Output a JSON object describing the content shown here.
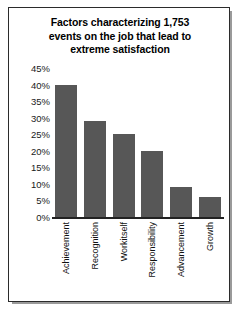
{
  "chart_data": {
    "type": "bar",
    "title": "Factors characterizing 1,753 events on the job that lead to extreme satisfaction",
    "title_lines": [
      "Factors characterizing 1,753",
      "events on the job that lead to",
      "extreme satisfaction"
    ],
    "categories": [
      "Achievement",
      "Recognition",
      "Workitself",
      "Responsibility",
      "Advancement",
      "Growth"
    ],
    "values": [
      40,
      29,
      25,
      20,
      9,
      6
    ],
    "value_labels": [
      "40%",
      "29%",
      "25%",
      "20%",
      "9%",
      "6%"
    ],
    "xlabel": "",
    "ylabel": "",
    "ylim": [
      0,
      45
    ],
    "ytick_values": [
      0,
      5,
      10,
      15,
      20,
      25,
      30,
      35,
      40,
      45
    ],
    "ytick_labels": [
      "0%",
      "5%",
      "10%",
      "15%",
      "20%",
      "25%",
      "30%",
      "35%",
      "40%",
      "45%"
    ],
    "grid": false,
    "legend": false,
    "bar_color": "#575757",
    "axis_color": "#222222",
    "background_color": "#ffffff",
    "border_color": "#2b2b2b"
  }
}
